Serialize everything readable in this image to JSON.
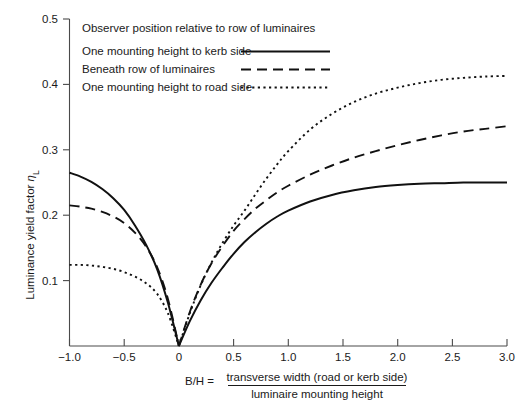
{
  "chart_data": {
    "type": "line",
    "title": "",
    "xlabel": "B/H = transverse width (road or kerb side) / luminaire mounting height",
    "ylabel": "Luminance yield factor ηL",
    "xlim": [
      -1.0,
      3.0
    ],
    "ylim": [
      0.0,
      0.5
    ],
    "grid": false,
    "legend_position": "top-left inside",
    "legend_title": "Observer position relative to row of luminaires",
    "xticks": [
      -1.0,
      -0.5,
      0,
      0.5,
      1.0,
      1.5,
      2.0,
      2.5,
      3.0
    ],
    "xtick_labels": [
      "−1.0",
      "−0.5",
      "0",
      "0.5",
      "1.0",
      "1.5",
      "2.0",
      "2.5",
      "3.0"
    ],
    "yticks": [
      0.0,
      0.1,
      0.2,
      0.3,
      0.4,
      0.5
    ],
    "ytick_labels": [
      "",
      "0.1",
      "0.2",
      "0.3",
      "0.4",
      "0.5"
    ],
    "x": [
      -1.0,
      -0.9,
      -0.8,
      -0.7,
      -0.6,
      -0.5,
      -0.4,
      -0.3,
      -0.2,
      -0.1,
      0.0,
      0.1,
      0.2,
      0.3,
      0.4,
      0.5,
      0.6,
      0.7,
      0.8,
      0.9,
      1.0,
      1.2,
      1.4,
      1.6,
      1.8,
      2.0,
      2.2,
      2.4,
      2.6,
      2.8,
      3.0
    ],
    "series": [
      {
        "name": "One mounting height to kerb side",
        "style": "solid",
        "color": "#111111",
        "values": [
          0.265,
          0.259,
          0.251,
          0.24,
          0.226,
          0.208,
          0.184,
          0.155,
          0.118,
          0.066,
          0.0,
          0.038,
          0.07,
          0.097,
          0.12,
          0.141,
          0.159,
          0.174,
          0.187,
          0.198,
          0.207,
          0.221,
          0.231,
          0.238,
          0.243,
          0.246,
          0.248,
          0.249,
          0.25,
          0.25,
          0.25
        ]
      },
      {
        "name": "Beneath row of luminaires",
        "style": "dashed",
        "color": "#111111",
        "values": [
          0.215,
          0.213,
          0.21,
          0.205,
          0.198,
          0.188,
          0.173,
          0.152,
          0.121,
          0.072,
          0.0,
          0.052,
          0.094,
          0.127,
          0.153,
          0.176,
          0.194,
          0.21,
          0.223,
          0.235,
          0.245,
          0.262,
          0.276,
          0.288,
          0.298,
          0.307,
          0.315,
          0.322,
          0.328,
          0.332,
          0.336
        ]
      },
      {
        "name": "One mounting height to road side",
        "style": "dotted",
        "color": "#111111",
        "values": [
          0.124,
          0.124,
          0.123,
          0.121,
          0.118,
          0.113,
          0.106,
          0.096,
          0.08,
          0.05,
          0.0,
          0.05,
          0.093,
          0.128,
          0.158,
          0.184,
          0.207,
          0.232,
          0.256,
          0.278,
          0.298,
          0.331,
          0.355,
          0.373,
          0.386,
          0.395,
          0.402,
          0.407,
          0.41,
          0.412,
          0.413
        ]
      }
    ],
    "annotations": []
  },
  "axis": {
    "y_label_main": "Luminance yield factor",
    "y_label_symbol": "η",
    "y_label_subscript": "L",
    "x_label_lhs": "B/H =",
    "x_label_numerator": "transverse width (road or kerb side)",
    "x_label_denominator": "luminaire mounting height"
  },
  "legend": {
    "title": "Observer position relative to row of luminaires",
    "entries": [
      {
        "label": "One mounting height to kerb side",
        "style": "solid"
      },
      {
        "label": "Beneath row of luminaires",
        "style": "dashed"
      },
      {
        "label": "One mounting height to road side",
        "style": "dotted"
      }
    ]
  },
  "colors": {
    "background": "#ffffff",
    "axis": "#4a4a4a",
    "curve": "#111111",
    "text": "#1a1a1a"
  }
}
